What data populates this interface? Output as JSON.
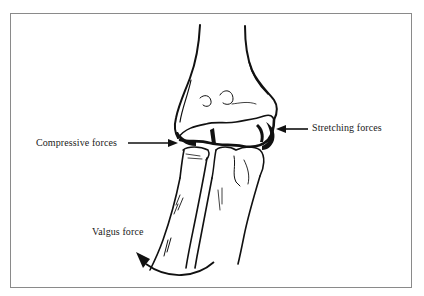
{
  "diagram": {
    "labels": {
      "compressive": "Compressive forces",
      "stretching": "Stretching forces",
      "valgus": "Valgus force"
    },
    "arrows": [
      {
        "name": "compressive-forces-arrow",
        "direction": "right",
        "points_to": "lateral joint (radiocapitellar)"
      },
      {
        "name": "stretching-forces-arrow",
        "direction": "left",
        "points_to": "medial joint"
      },
      {
        "name": "valgus-force-arrow",
        "shape": "curved",
        "direction": "counter-clockwise, up-left"
      }
    ],
    "colors": {
      "ink": "#111111",
      "frame": "#8a8a8a",
      "background": "#ffffff"
    }
  }
}
